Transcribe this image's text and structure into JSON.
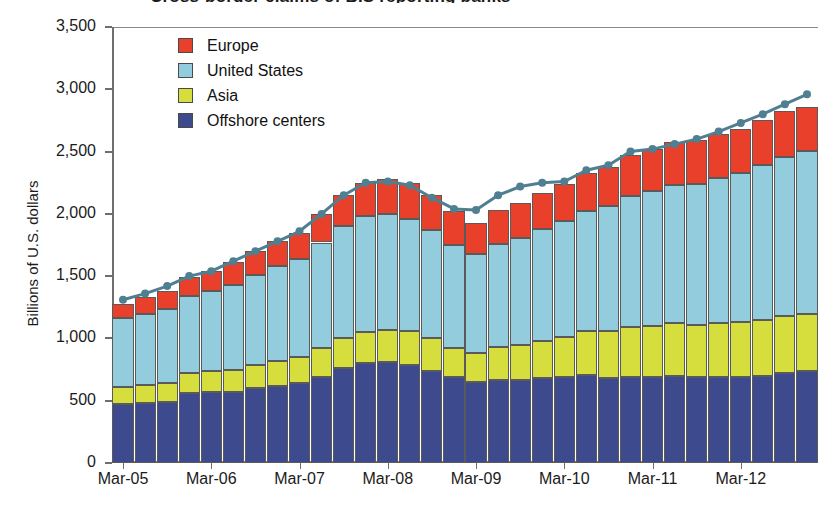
{
  "chart_data": {
    "type": "bar",
    "stacked": true,
    "title": "Cross-border claims of BIS reporting banks",
    "xlabel": "",
    "ylabel": "Billions of U.S. dollars",
    "ylim": [
      0,
      3500
    ],
    "ytick_labels": [
      "3,500",
      "3,000",
      "2,500",
      "2,000",
      "1,500",
      "1,000",
      "500",
      "0"
    ],
    "ytick_values": [
      3500,
      3000,
      2500,
      2000,
      1500,
      1000,
      500,
      0
    ],
    "xtick_labels": [
      "Mar-05",
      "Mar-06",
      "Mar-07",
      "Mar-08",
      "Mar-09",
      "Mar-10",
      "Mar-11",
      "Mar-12"
    ],
    "xtick_indices": [
      0,
      4,
      8,
      12,
      16,
      20,
      24,
      28
    ],
    "grid": false,
    "legend_position": "upper-left",
    "categories": [
      "Mar-05",
      "Jun-05",
      "Sep-05",
      "Dec-05",
      "Mar-06",
      "Jun-06",
      "Sep-06",
      "Dec-06",
      "Mar-07",
      "Jun-07",
      "Sep-07",
      "Dec-07",
      "Mar-08",
      "Jun-08",
      "Sep-08",
      "Dec-08",
      "Mar-09",
      "Jun-09",
      "Sep-09",
      "Dec-09",
      "Mar-10",
      "Jun-10",
      "Sep-10",
      "Dec-10",
      "Mar-11",
      "Jun-11",
      "Sep-11",
      "Dec-11",
      "Mar-12",
      "Jun-12",
      "Sep-12",
      "Dec-12"
    ],
    "series": [
      {
        "name": "Offshore centers",
        "color": "#3d4a8e",
        "values": [
          470,
          480,
          490,
          560,
          570,
          570,
          600,
          620,
          640,
          690,
          760,
          800,
          810,
          790,
          740,
          690,
          650,
          670,
          670,
          680,
          690,
          710,
          680,
          690,
          690,
          700,
          690,
          690,
          690,
          700,
          720,
          735
        ]
      },
      {
        "name": "Asia",
        "color": "#d5de3c",
        "values": [
          140,
          150,
          150,
          160,
          170,
          180,
          190,
          200,
          210,
          230,
          240,
          250,
          260,
          270,
          260,
          230,
          230,
          260,
          280,
          300,
          320,
          350,
          380,
          400,
          410,
          420,
          420,
          430,
          440,
          450,
          460,
          465
        ]
      },
      {
        "name": "United States",
        "color": "#93cddd",
        "values": [
          550,
          570,
          600,
          620,
          640,
          680,
          720,
          760,
          790,
          850,
          900,
          930,
          930,
          900,
          870,
          830,
          800,
          830,
          860,
          900,
          930,
          960,
          1000,
          1050,
          1080,
          1110,
          1130,
          1170,
          1200,
          1240,
          1280,
          1305
        ]
      },
      {
        "name": "Europe",
        "color": "#e8402a",
        "values": [
          120,
          130,
          140,
          150,
          160,
          180,
          190,
          200,
          210,
          230,
          250,
          270,
          280,
          290,
          280,
          270,
          250,
          270,
          280,
          290,
          300,
          310,
          320,
          330,
          340,
          350,
          350,
          350,
          355,
          360,
          365,
          355
        ]
      }
    ],
    "overlay_line": {
      "name": "Total",
      "color": "#4f7f91",
      "marker": "circle",
      "values": [
        1310,
        1360,
        1420,
        1500,
        1540,
        1620,
        1700,
        1780,
        1860,
        2000,
        2150,
        2250,
        2260,
        2230,
        2130,
        2040,
        2030,
        2150,
        2220,
        2250,
        2260,
        2350,
        2390,
        2500,
        2520,
        2560,
        2600,
        2660,
        2730,
        2800,
        2880,
        2960
      ]
    }
  },
  "legend": {
    "items": [
      {
        "label": "Europe",
        "color": "#e8402a"
      },
      {
        "label": "United States",
        "color": "#93cddd"
      },
      {
        "label": "Asia",
        "color": "#d5de3c"
      },
      {
        "label": "Offshore centers",
        "color": "#3d4a8e"
      }
    ]
  }
}
